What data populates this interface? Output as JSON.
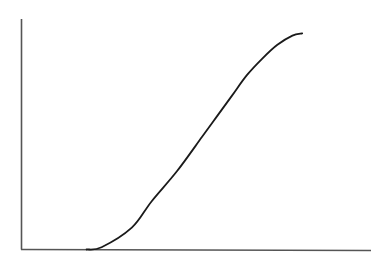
{
  "chart_data": {
    "type": "line",
    "title": "",
    "xlabel": "",
    "ylabel": "",
    "grid": false,
    "legend": null,
    "axis_color": "#555555",
    "curve_color": "#1a1a1a",
    "xlim": [
      0,
      100
    ],
    "ylim": [
      0,
      100
    ],
    "series": [
      {
        "name": "curve",
        "x": [
          18.6,
          22.9,
          31.5,
          37.2,
          44.4,
          51.6,
          55.9,
          60.2,
          64.5,
          68.8,
          73.1,
          77.4,
          80.2
        ],
        "y": [
          0,
          1,
          9.5,
          21,
          34,
          49,
          58,
          67,
          76,
          83,
          89,
          93,
          94
        ]
      }
    ]
  }
}
